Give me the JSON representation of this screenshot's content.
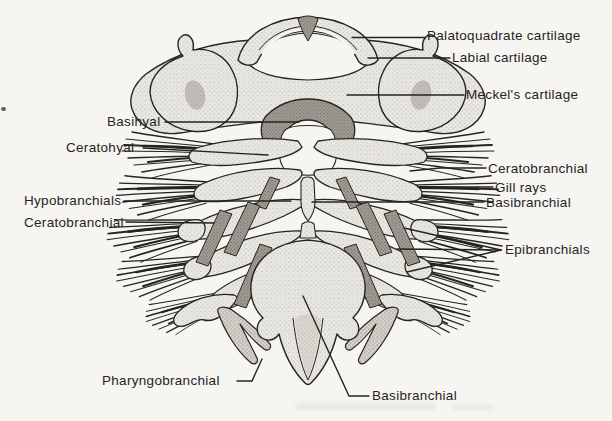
{
  "labels": {
    "palatoquadrate": "Palatoquadrate cartilage",
    "labial": "Labial cartilage",
    "meckels": "Meckel's cartilage",
    "basihyal": "Basihyal",
    "ceratohyal": "Ceratohyal",
    "hypobranchials": "Hypobranchials",
    "ceratobranchial_left": "Ceratobranchial",
    "ceratobranchial_right": "Ceratobranchial",
    "gill_rays": "Gill rays",
    "basibranchial_right": "Basibranchial",
    "epibranchials": "Epibranchials",
    "pharyngobranchial": "Pharyngobranchial",
    "basibranchial_bottom": "Basibranchial"
  },
  "colors": {
    "ink": "#26241f",
    "paper": "#f6f5f2",
    "cartilage_light": "#e9e7e1",
    "cartilage_mid": "#d3d0c9",
    "cartilage_dark": "#a19e96",
    "label_text": "#26241f"
  }
}
